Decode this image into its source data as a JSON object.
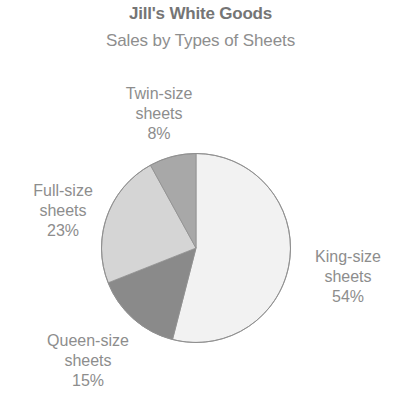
{
  "chart_data": {
    "type": "pie",
    "title": "Jill's White Goods",
    "subtitle": "Sales by Types of Sheets",
    "xlabel": "",
    "ylabel": "",
    "grid": false,
    "legend_position": "none",
    "labels_outside": true,
    "start_angle_deg": 0,
    "direction": "clockwise",
    "categories": [
      "King-size sheets",
      "Queen-size sheets",
      "Full-size sheets",
      "Twin-size sheets"
    ],
    "values": [
      54,
      15,
      23,
      8
    ],
    "value_unit": "%",
    "colors": [
      "#f2f2f2",
      "#8a8a8a",
      "#d5d5d5",
      "#a8a8a8"
    ],
    "slice_outline_color": "#8f8f8f",
    "slices": [
      {
        "name": "king",
        "category": "King-size sheets",
        "value": 54,
        "value_text": "54%",
        "color": "#f2f2f2",
        "label_lines": [
          "King-size",
          "sheets",
          "54%"
        ]
      },
      {
        "name": "queen",
        "category": "Queen-size sheets",
        "value": 15,
        "value_text": "15%",
        "color": "#8a8a8a",
        "label_lines": [
          "Queen-size",
          "sheets",
          "15%"
        ]
      },
      {
        "name": "full",
        "category": "Full-size sheets",
        "value": 23,
        "value_text": "23%",
        "color": "#d5d5d5",
        "label_lines": [
          "Full-size",
          "sheets",
          "23%"
        ]
      },
      {
        "name": "twin",
        "category": "Twin-size sheets",
        "value": 8,
        "value_text": "8%",
        "color": "#a8a8a8",
        "label_lines": [
          "Twin-size",
          "sheets",
          "8%"
        ]
      }
    ]
  },
  "labels": {
    "twin": {
      "line1": "Twin-size",
      "line2": "sheets",
      "line3": "8%"
    },
    "full": {
      "line1": "Full-size",
      "line2": "sheets",
      "line3": "23%"
    },
    "queen": {
      "line1": "Queen-size",
      "line2": "sheets",
      "line3": "15%"
    },
    "king": {
      "line1": "King-size",
      "line2": "sheets",
      "line3": "54%"
    }
  },
  "colors": {
    "title_text": "#757575",
    "subtitle_text": "#8e8e8e",
    "label_text": "#8d8d8d",
    "background": "#ffffff"
  }
}
